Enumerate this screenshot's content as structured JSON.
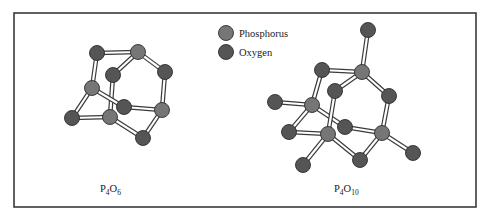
{
  "colors": {
    "phosphorus": "#767676",
    "oxygen": "#555555",
    "frame": "#3a3a3a"
  },
  "atom_radius": 7.5,
  "frame": {
    "x": 14,
    "y": 13,
    "width": 462,
    "height": 194
  },
  "legend": {
    "items": [
      {
        "label": "Phosphorus",
        "element": "phosphorus",
        "cx": 226,
        "cy": 33
      },
      {
        "label": "Oxygen",
        "element": "oxygen",
        "cx": 226,
        "cy": 52
      }
    ]
  },
  "molecules": [
    {
      "name": "P4O6",
      "label": {
        "main1": "P",
        "sub1": "4",
        "main2": "O",
        "sub2": "6",
        "x": 100,
        "y": 192
      },
      "atoms": [
        {
          "id": "O1",
          "element": "oxygen",
          "x": 97,
          "y": 53
        },
        {
          "id": "P1",
          "element": "phosphorus",
          "x": 138,
          "y": 52
        },
        {
          "id": "O2",
          "element": "oxygen",
          "x": 113,
          "y": 75
        },
        {
          "id": "O3",
          "element": "oxygen",
          "x": 165,
          "y": 72
        },
        {
          "id": "P2",
          "element": "phosphorus",
          "x": 92,
          "y": 88
        },
        {
          "id": "O4",
          "element": "oxygen",
          "x": 124,
          "y": 107
        },
        {
          "id": "P3",
          "element": "phosphorus",
          "x": 162,
          "y": 110
        },
        {
          "id": "O5",
          "element": "oxygen",
          "x": 72,
          "y": 118
        },
        {
          "id": "P4",
          "element": "phosphorus",
          "x": 110,
          "y": 117
        },
        {
          "id": "O6",
          "element": "oxygen",
          "x": 143,
          "y": 138
        }
      ],
      "bonds": [
        [
          "O1",
          "P1"
        ],
        [
          "O1",
          "P2"
        ],
        [
          "P1",
          "O2"
        ],
        [
          "P1",
          "O3"
        ],
        [
          "O3",
          "P3"
        ],
        [
          "O2",
          "P4"
        ],
        [
          "P2",
          "O4"
        ],
        [
          "P2",
          "O5"
        ],
        [
          "O5",
          "P4"
        ],
        [
          "O4",
          "P3"
        ],
        [
          "P4",
          "O6"
        ],
        [
          "O6",
          "P3"
        ]
      ],
      "draw_order": [
        "O1",
        "P1",
        "O3",
        "P2",
        "O5",
        "O4",
        "P3",
        "O6",
        "O2",
        "P4"
      ]
    },
    {
      "name": "P4O10",
      "label": {
        "main1": "P",
        "sub1": "4",
        "main2": "O",
        "sub2": "10",
        "x": 334,
        "y": 192
      },
      "atoms": [
        {
          "id": "Ot1",
          "element": "oxygen",
          "x": 368,
          "y": 30
        },
        {
          "id": "O1",
          "element": "oxygen",
          "x": 322,
          "y": 70
        },
        {
          "id": "P1",
          "element": "phosphorus",
          "x": 362,
          "y": 72
        },
        {
          "id": "O2",
          "element": "oxygen",
          "x": 335,
          "y": 91
        },
        {
          "id": "O3",
          "element": "oxygen",
          "x": 389,
          "y": 96
        },
        {
          "id": "Ot2",
          "element": "oxygen",
          "x": 275,
          "y": 102
        },
        {
          "id": "P2",
          "element": "phosphorus",
          "x": 312,
          "y": 105
        },
        {
          "id": "O4",
          "element": "oxygen",
          "x": 345,
          "y": 127
        },
        {
          "id": "P3",
          "element": "phosphorus",
          "x": 382,
          "y": 133
        },
        {
          "id": "O5",
          "element": "oxygen",
          "x": 289,
          "y": 132
        },
        {
          "id": "P4",
          "element": "phosphorus",
          "x": 328,
          "y": 134
        },
        {
          "id": "Ot3",
          "element": "oxygen",
          "x": 413,
          "y": 153
        },
        {
          "id": "O6",
          "element": "oxygen",
          "x": 360,
          "y": 160
        },
        {
          "id": "Ot4",
          "element": "oxygen",
          "x": 303,
          "y": 165
        }
      ],
      "bonds": [
        [
          "Ot1",
          "P1"
        ],
        [
          "O1",
          "P1"
        ],
        [
          "O1",
          "P2"
        ],
        [
          "P1",
          "O2"
        ],
        [
          "P1",
          "O3"
        ],
        [
          "O3",
          "P3"
        ],
        [
          "Ot2",
          "P2"
        ],
        [
          "P2",
          "O4"
        ],
        [
          "P2",
          "O5"
        ],
        [
          "O5",
          "P4"
        ],
        [
          "O2",
          "P4"
        ],
        [
          "O4",
          "P3"
        ],
        [
          "P4",
          "O6"
        ],
        [
          "O6",
          "P3"
        ],
        [
          "P3",
          "Ot3"
        ],
        [
          "P4",
          "Ot4"
        ]
      ],
      "draw_order": [
        "Ot1",
        "O1",
        "P1",
        "O3",
        "Ot2",
        "P2",
        "O5",
        "O4",
        "P3",
        "Ot3",
        "O6",
        "Ot4",
        "O2",
        "P4"
      ]
    }
  ]
}
